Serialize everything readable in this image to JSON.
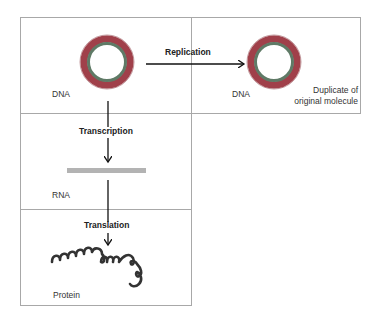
{
  "diagram": {
    "colors": {
      "ring_outer": "#a0404a",
      "ring_inner": "#5f7a66",
      "rna_bar": "#b3b3b3",
      "protein": "#333333",
      "box_border": "#a8a8a8",
      "arrow": "#111111"
    },
    "boxes": [
      {
        "id": "dna-original",
        "label": "DNA"
      },
      {
        "id": "dna-duplicate",
        "label": "DNA",
        "caption": [
          "Duplicate of",
          "original molecule"
        ]
      },
      {
        "id": "rna",
        "label": "RNA"
      },
      {
        "id": "protein",
        "label": "Protein"
      }
    ],
    "processes": {
      "replication": "Replication",
      "transcription": "Transcription",
      "translation": "Translation"
    }
  }
}
